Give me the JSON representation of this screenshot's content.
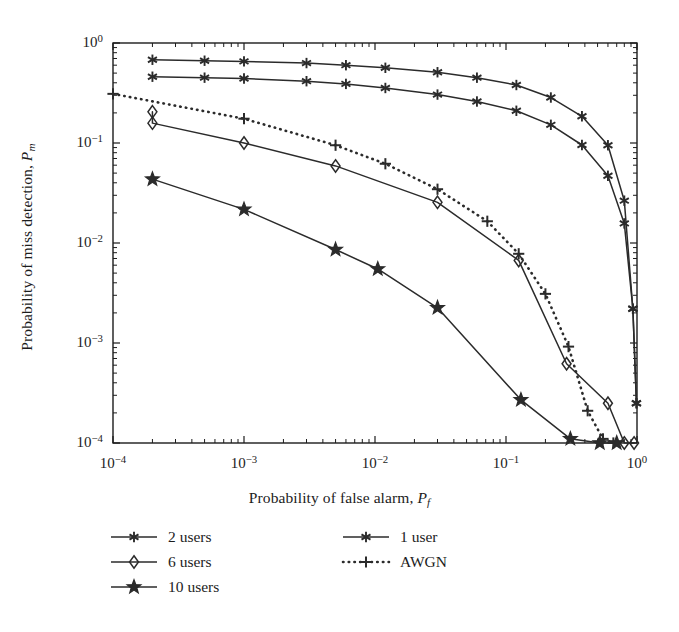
{
  "chart_data": {
    "type": "line",
    "title": "",
    "xlabel": "Probability of false alarm, Pf",
    "ylabel": "Probability of miss detection, Pm",
    "xscale": "log",
    "yscale": "log",
    "xlim": [
      0.0001,
      1
    ],
    "ylim": [
      0.0001,
      1
    ],
    "xticks": [
      0.0001,
      0.001,
      0.01,
      0.1,
      1
    ],
    "xtick_labels": [
      "10-4",
      "10-3",
      "10-2",
      "10-1",
      "100"
    ],
    "yticks": [
      0.0001,
      0.001,
      0.01,
      0.1,
      1
    ],
    "ytick_labels": [
      "10-4",
      "10-3",
      "10-2",
      "10-1",
      "100"
    ],
    "grid": false,
    "minor_ticks": true,
    "legend_position": "below-plot",
    "series": [
      {
        "name": "2 users",
        "marker": "asterisk",
        "linestyle": "solid",
        "color": "#2b2b2b",
        "x": [
          0.0002,
          0.0005,
          0.001,
          0.003,
          0.006,
          0.012,
          0.03,
          0.06,
          0.12,
          0.22,
          0.38,
          0.6,
          0.8,
          0.93,
          0.99
        ],
        "y": [
          0.68,
          0.665,
          0.655,
          0.63,
          0.6,
          0.565,
          0.51,
          0.45,
          0.38,
          0.285,
          0.185,
          0.095,
          0.0265,
          0.0022,
          0.00025
        ]
      },
      {
        "name": "1 user",
        "marker": "asterisk",
        "linestyle": "solid",
        "color": "#2b2b2b",
        "x": [
          0.0002,
          0.0005,
          0.001,
          0.003,
          0.006,
          0.012,
          0.03,
          0.06,
          0.12,
          0.22,
          0.38,
          0.6,
          0.8,
          0.93,
          0.99
        ],
        "y": [
          0.46,
          0.45,
          0.442,
          0.415,
          0.39,
          0.355,
          0.305,
          0.26,
          0.21,
          0.152,
          0.0955,
          0.047,
          0.0157,
          0.0022,
          0.00025
        ]
      },
      {
        "name": "6 users",
        "marker": "diamond",
        "linestyle": "solid",
        "color": "#2b2b2b",
        "x": [
          0.0002,
          0.0002,
          0.001,
          0.005,
          0.03,
          0.125,
          0.29,
          0.6,
          0.8,
          0.95
        ],
        "y": [
          0.205,
          0.158,
          0.1,
          0.059,
          0.0255,
          0.0067,
          0.00062,
          0.00025,
          0.0001,
          0.0001
        ]
      },
      {
        "name": "10 users",
        "marker": "star",
        "linestyle": "solid",
        "color": "#2b2b2b",
        "x": [
          0.0002,
          0.001,
          0.005,
          0.0105,
          0.03,
          0.13,
          0.31,
          0.52,
          0.7
        ],
        "y": [
          0.0435,
          0.0217,
          0.0086,
          0.0055,
          0.00225,
          0.00027,
          0.00011,
          0.0001,
          0.0001
        ]
      },
      {
        "name": "AWGN",
        "marker": "plus",
        "linestyle": "dotted",
        "color": "#2b2b2b",
        "x": [
          0.0001,
          0.001,
          0.005,
          0.012,
          0.03,
          0.072,
          0.125,
          0.2,
          0.3,
          0.42,
          0.55,
          0.66
        ],
        "y": [
          0.31,
          0.175,
          0.095,
          0.062,
          0.0345,
          0.0165,
          0.0078,
          0.0031,
          0.00092,
          0.00021,
          0.00011,
          0.0001
        ]
      }
    ]
  },
  "axes": {
    "x_title_main": "Probability of false alarm, ",
    "x_title_var": "P",
    "x_title_sub": "f",
    "y_title_main": "Probability of miss detection, ",
    "y_title_var": "P",
    "y_title_sub": "m",
    "xticks": [
      {
        "base": "10",
        "exp": "−4"
      },
      {
        "base": "10",
        "exp": "−3"
      },
      {
        "base": "10",
        "exp": "−2"
      },
      {
        "base": "10",
        "exp": "−1"
      },
      {
        "base": "10",
        "exp": "0"
      }
    ],
    "yticks": [
      {
        "base": "10",
        "exp": "0"
      },
      {
        "base": "10",
        "exp": "−1"
      },
      {
        "base": "10",
        "exp": "−2"
      },
      {
        "base": "10",
        "exp": "−3"
      },
      {
        "base": "10",
        "exp": "−4"
      }
    ]
  },
  "legend": {
    "left_column": [
      {
        "label": "2 users",
        "marker": "asterisk",
        "style": "solid"
      },
      {
        "label": "6 users",
        "marker": "diamond",
        "style": "solid"
      },
      {
        "label": "10 users",
        "marker": "star",
        "style": "solid"
      }
    ],
    "right_column": [
      {
        "label": "1 user",
        "marker": "asterisk",
        "style": "solid"
      },
      {
        "label": "AWGN",
        "marker": "plus",
        "style": "dotted"
      }
    ]
  },
  "colors": {
    "line": "#2b2b2b",
    "axis": "#1c1c1c",
    "background": "#ffffff"
  }
}
